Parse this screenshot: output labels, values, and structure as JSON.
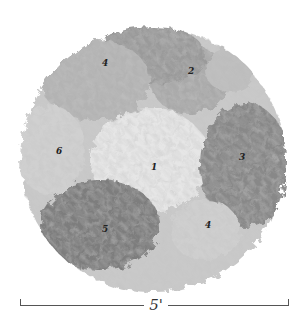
{
  "figure": {
    "zones": [
      {
        "label": "1",
        "x": 153,
        "y": 168,
        "tone": "#e4e4e4"
      },
      {
        "label": "2",
        "x": 190,
        "y": 70,
        "tone": "#a8a8a8"
      },
      {
        "label": "3",
        "x": 241,
        "y": 156,
        "tone": "#8a8a8a"
      },
      {
        "label": "4",
        "x": 104,
        "y": 62,
        "tone": "#b0b0b0"
      },
      {
        "label": "4",
        "x": 207,
        "y": 224,
        "tone": "#c8c8c8"
      },
      {
        "label": "5",
        "x": 104,
        "y": 228,
        "tone": "#7a7a7a"
      },
      {
        "label": "6",
        "x": 58,
        "y": 150,
        "tone": "#cccccc"
      }
    ],
    "scale_bar": {
      "label": "5'",
      "x_start": 20,
      "x_end": 289,
      "y": 305
    }
  }
}
